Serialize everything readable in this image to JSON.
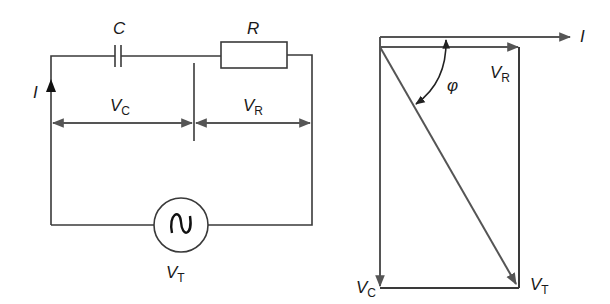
{
  "circuit": {
    "capacitor_label": "C",
    "resistor_label": "R",
    "current_label": "I",
    "vc_label": {
      "main": "V",
      "sub": "C"
    },
    "vr_label": {
      "main": "V",
      "sub": "R"
    },
    "vt_label": {
      "main": "V",
      "sub": "T"
    },
    "source_icon": "ac-source-icon"
  },
  "phasor": {
    "current_label": "I",
    "vr_label": {
      "main": "V",
      "sub": "R"
    },
    "vc_label": {
      "main": "V",
      "sub": "C"
    },
    "vt_label": {
      "main": "V",
      "sub": "T"
    },
    "angle_label": "φ"
  },
  "colors": {
    "wire": "#3a3a3a",
    "vector": "#555555",
    "background": "#ffffff"
  }
}
